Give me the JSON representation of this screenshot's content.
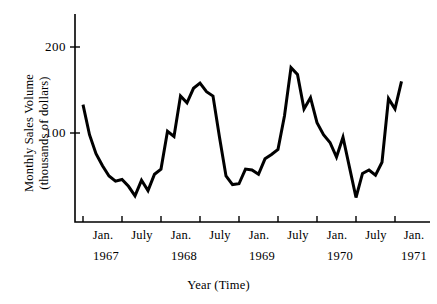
{
  "chart_data": {
    "type": "line",
    "title": "",
    "xlabel": "Year (Time)",
    "ylabel": "Monthly Sales Volume (thousands of dollars)",
    "ylabel_lines": [
      "Monthly Sales Volume",
      "(thousands of dollars)"
    ],
    "ytick_labels": [
      "200",
      "100"
    ],
    "ytick_values": [
      200,
      100
    ],
    "ylim": [
      0,
      240
    ],
    "grid": false,
    "legend": null,
    "xtick_labels": [
      "Jan.",
      "July",
      "Jan.",
      "July",
      "Jan.",
      "July",
      "Jan.",
      "July",
      "Jan."
    ],
    "xtick_months": [
      "1967-01",
      "1967-07",
      "1968-01",
      "1968-07",
      "1969-01",
      "1969-07",
      "1970-01",
      "1970-07",
      "1971-01"
    ],
    "year_labels": [
      "1967",
      "1968",
      "1969",
      "1970",
      "1971"
    ],
    "series": [
      {
        "name": "Monthly Sales Volume",
        "color": "#000000",
        "x": [
          "1967-01",
          "1967-02",
          "1967-03",
          "1967-04",
          "1967-05",
          "1967-06",
          "1967-07",
          "1967-08",
          "1967-09",
          "1967-10",
          "1967-11",
          "1967-12",
          "1968-01",
          "1968-02",
          "1968-03",
          "1968-04",
          "1968-05",
          "1968-06",
          "1968-07",
          "1968-08",
          "1968-09",
          "1968-10",
          "1968-11",
          "1968-12",
          "1969-01",
          "1969-02",
          "1969-03",
          "1969-04",
          "1969-05",
          "1969-06",
          "1969-07",
          "1969-08",
          "1969-09",
          "1969-10",
          "1969-11",
          "1969-12",
          "1970-01",
          "1970-02",
          "1970-03",
          "1970-04",
          "1970-05",
          "1970-06",
          "1970-07",
          "1970-08",
          "1970-09",
          "1970-10",
          "1970-11",
          "1970-12",
          "1971-01",
          "1971-02"
        ],
        "values": [
          133,
          98,
          76,
          62,
          50,
          44,
          46,
          38,
          27,
          45,
          33,
          52,
          58,
          102,
          96,
          143,
          135,
          152,
          158,
          148,
          143,
          95,
          50,
          40,
          41,
          58,
          57,
          52,
          70,
          75,
          81,
          120,
          176,
          168,
          128,
          141,
          112,
          98,
          89,
          72,
          95,
          60,
          25,
          53,
          57,
          51,
          66,
          140,
          128,
          160
        ]
      }
    ],
    "annotations": []
  },
  "axis": {
    "y_ticks": [
      {
        "label": "200",
        "value": 200
      },
      {
        "label": "100",
        "value": 100
      }
    ],
    "x_ticks": [
      {
        "label": "Jan.",
        "year": "1967"
      },
      {
        "label": "July",
        "year": ""
      },
      {
        "label": "Jan.",
        "year": "1968"
      },
      {
        "label": "July",
        "year": ""
      },
      {
        "label": "Jan.",
        "year": "1969"
      },
      {
        "label": "July",
        "year": ""
      },
      {
        "label": "Jan.",
        "year": "1970"
      },
      {
        "label": "July",
        "year": ""
      },
      {
        "label": "Jan.",
        "year": "1971"
      }
    ]
  },
  "labels": {
    "xaxis_title": "Year (Time)",
    "yaxis_line1": "Monthly Sales Volume",
    "yaxis_line2": "(thousands of dollars)",
    "ytick_200": "200",
    "ytick_100": "100",
    "xtick_0": "Jan.",
    "xtick_1": "July",
    "xtick_2": "Jan.",
    "xtick_3": "July",
    "xtick_4": "Jan.",
    "xtick_5": "July",
    "xtick_6": "Jan.",
    "xtick_7": "July",
    "xtick_8": "Jan.",
    "year_0": "1967",
    "year_1": "1968",
    "year_2": "1969",
    "year_3": "1970",
    "year_4": "1971"
  },
  "style": {
    "line_color": "#000000",
    "axis_color": "#000000",
    "background": "#ffffff"
  }
}
